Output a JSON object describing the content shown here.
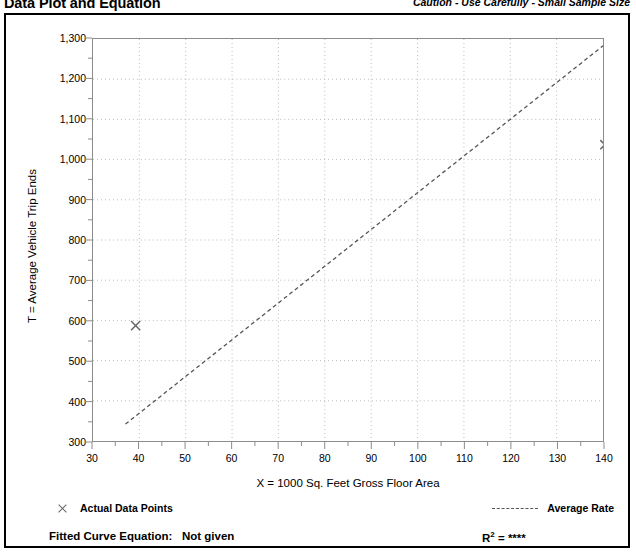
{
  "header": {
    "title": "Data Plot and Equation",
    "caution": "Caution - Use Carefully - Small Sample Size"
  },
  "legend": {
    "data_points_label": "Actual Data Points",
    "average_rate_label": "Average Rate",
    "marker_icon": "x-marker-icon",
    "line_icon": "dashed-line-icon"
  },
  "equation": {
    "fitted_curve_label": "Fitted Curve Equation:",
    "fitted_curve_value": "Not given",
    "r_squared_label": "R",
    "r_squared_exponent": "2",
    "r_squared_equals": " = ",
    "r_squared_value": "****"
  },
  "colors": {
    "axis": "#8c8c8c",
    "grid": "#b9b9b9",
    "marker": "#666666",
    "trend": "#555555",
    "border": "#000000"
  },
  "chart_data": {
    "type": "scatter",
    "title": "Data Plot and Equation",
    "subtitle": "Caution - Use Carefully - Small Sample Size",
    "xlabel": "X = 1000 Sq. Feet Gross Floor Area",
    "ylabel": "T = Average Vehicle Trip Ends",
    "xlim": [
      30,
      140
    ],
    "ylim": [
      300,
      1300
    ],
    "xticks": [
      30,
      40,
      50,
      60,
      70,
      80,
      90,
      100,
      110,
      120,
      130,
      140
    ],
    "xtick_labels": [
      "30",
      "40",
      "50",
      "60",
      "70",
      "80",
      "90",
      "100",
      "110",
      "120",
      "130",
      "140"
    ],
    "yticks": [
      300,
      400,
      500,
      600,
      700,
      800,
      900,
      1000,
      1100,
      1200,
      1300
    ],
    "ytick_labels": [
      "300",
      "400",
      "500",
      "600",
      "700",
      "800",
      "900",
      "1,000",
      "1,100",
      "1,200",
      "1,300"
    ],
    "x_minor_tick_interval": 5,
    "y_minor_tick_interval": 50,
    "grid": true,
    "grid_style": "dotted",
    "legend_position": "below-plot",
    "series": [
      {
        "name": "Actual Data Points",
        "type": "scatter",
        "marker": "x",
        "points": [
          {
            "x": 39.2,
            "y": 587
          },
          {
            "x": 140.4,
            "y": 1037
          }
        ]
      },
      {
        "name": "Average Rate",
        "type": "line",
        "style": "dashed",
        "points": [
          {
            "x": 37.0,
            "y": 342
          },
          {
            "x": 140.0,
            "y": 1283
          }
        ]
      }
    ]
  }
}
